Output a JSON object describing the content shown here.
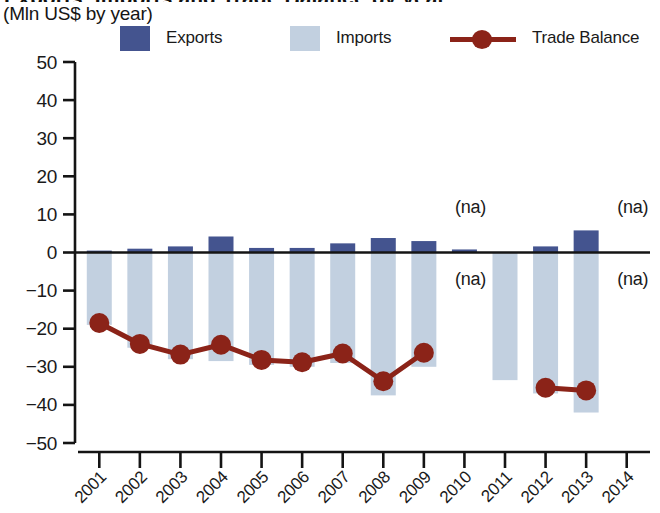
{
  "header": {
    "title_clipped": "Exports, Imports and Trade Balance by year",
    "subtitle": "(Mln US$ by year)"
  },
  "legend": {
    "items": [
      {
        "label": "Exports",
        "marker": "square-swatch",
        "color": "#44548f"
      },
      {
        "label": "Imports",
        "marker": "square-swatch",
        "color": "#c2d0e0"
      },
      {
        "label": "Trade Balance",
        "marker": "line-with-dot",
        "color": "#8b2318"
      }
    ]
  },
  "colors": {
    "exports": "#44548f",
    "imports": "#c2d0e0",
    "trade_balance": "#8b2318",
    "axis": "#141414",
    "text": "#1a1a1a"
  },
  "chart_data": {
    "type": "bar",
    "title": "Exports, Imports and Trade Balance by year",
    "subtitle": "(Mln US$ by year)",
    "xlabel": "",
    "ylabel": "Mln US$",
    "ylim": [
      -50,
      50
    ],
    "yticks": [
      50,
      40,
      30,
      20,
      10,
      0,
      -10,
      -20,
      -30,
      -40,
      -50
    ],
    "ytick_labels": [
      "50",
      "40",
      "30",
      "20",
      "10",
      "0",
      "−10",
      "−20",
      "−30",
      "−40",
      "−50"
    ],
    "grid": false,
    "legend_position": "top",
    "categories": [
      "2001",
      "2002",
      "2003",
      "2004",
      "2005",
      "2006",
      "2007",
      "2008",
      "2009",
      "2010",
      "2011",
      "2012",
      "2013",
      "2014"
    ],
    "series": [
      {
        "name": "Exports",
        "type": "bar",
        "color": "#44548f",
        "values": [
          0.5,
          1.0,
          1.6,
          4.2,
          1.2,
          1.2,
          2.4,
          3.8,
          3.0,
          0.8,
          null,
          1.6,
          5.8,
          null
        ],
        "na": [
          "2011",
          "2014"
        ]
      },
      {
        "name": "Imports",
        "type": "bar",
        "color": "#c2d0e0",
        "values": [
          -19.0,
          -25.0,
          -28.0,
          -28.5,
          -29.5,
          -30.0,
          -29.0,
          -37.5,
          -30.0,
          null,
          -33.5,
          -37.0,
          -42.0,
          null
        ],
        "na": [
          "2010",
          "2014"
        ]
      },
      {
        "name": "Trade Balance",
        "type": "line",
        "color": "#8b2318",
        "values": [
          -18.5,
          -24.0,
          -26.8,
          -24.2,
          -28.2,
          -28.8,
          -26.5,
          -33.8,
          -26.3,
          null,
          null,
          -35.5,
          -36.2,
          null
        ],
        "na": [
          "2010",
          "2011",
          "2014"
        ]
      }
    ],
    "annotations": [
      {
        "text": "(na)",
        "x": "2010",
        "y": 12,
        "series": "Imports"
      },
      {
        "text": "(na)",
        "x": "2010",
        "y": -7,
        "series": "Imports"
      },
      {
        "text": "(na)",
        "x": "2014",
        "y": 12,
        "series": "Exports"
      },
      {
        "text": "(na)",
        "x": "2014",
        "y": -7,
        "series": "Imports"
      }
    ]
  }
}
